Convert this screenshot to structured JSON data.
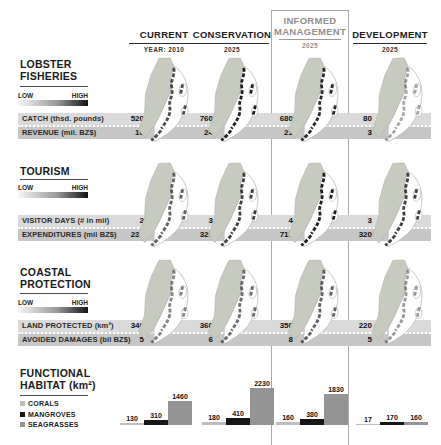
{
  "header": {
    "columns": [
      {
        "label": "CURRENT",
        "sublabel": "YEAR: 2010"
      },
      {
        "label": "CONSERVATION",
        "sublabel": "2025"
      },
      {
        "label": "INFORMED MANAGEMENT",
        "sublabel": "2025"
      },
      {
        "label": "DEVELOPMENT",
        "sublabel": "2025"
      }
    ]
  },
  "scale": {
    "low": "LOW",
    "high": "HIGH"
  },
  "sections": [
    {
      "title_line1": "LOBSTER",
      "title_line2": "FISHERIES",
      "rows": [
        {
          "label": "CATCH (thsd. pounds)",
          "values": [
            "520",
            "760",
            "680",
            "80"
          ]
        },
        {
          "label": "REVENUE (mil. BZ$)",
          "values": [
            "16",
            "24",
            "21",
            "3"
          ]
        }
      ],
      "map_intensity": [
        0.8,
        1,
        0.95,
        0.4
      ]
    },
    {
      "title_line1": "TOURISM",
      "title_line2": "",
      "rows": [
        {
          "label": "VISITOR DAYS (# in mil)",
          "values": [
            "2",
            "3",
            "4",
            "3"
          ]
        },
        {
          "label": "EXPENDITURES (mil BZ$)",
          "values": [
            "230",
            "320",
            "710",
            "320"
          ]
        }
      ],
      "map_intensity": [
        0.7,
        0.85,
        1,
        0.85
      ]
    },
    {
      "title_line1": "COASTAL",
      "title_line2": "PROTECTION",
      "rows": [
        {
          "label": "LAND PROTECTED (km²)",
          "values": [
            "340",
            "360",
            "350",
            "220"
          ]
        },
        {
          "label": "AVOIDED DAMAGES (bil BZ$)",
          "values": [
            "5",
            "6",
            "8",
            "5"
          ]
        }
      ],
      "map_intensity": [
        0.55,
        0.65,
        0.7,
        0.45
      ]
    }
  ],
  "habitat": {
    "title_line1": "FUNCTIONAL",
    "title_line2": "HABITAT (km²)",
    "legend": [
      {
        "label": "CORALS",
        "color": "#bdbdbd"
      },
      {
        "label": "MANGROVES",
        "color": "#161616"
      },
      {
        "label": "SEAGRASSES",
        "color": "#949494"
      }
    ],
    "groups": [
      {
        "column": "CURRENT",
        "values": [
          130,
          310,
          1460
        ]
      },
      {
        "column": "CONSERVATION",
        "values": [
          180,
          410,
          2230
        ]
      },
      {
        "column": "INFORMED MANAGEMENT",
        "values": [
          160,
          380,
          1830
        ]
      },
      {
        "column": "DEVELOPMENT",
        "values": [
          17,
          170,
          160
        ]
      }
    ]
  },
  "colors": {
    "band_light": "#dadada",
    "band_dark": "#c6c6c6",
    "map_land": "#c6cabf",
    "reef_dark": "#1f1f1f",
    "frame": "#ababab",
    "header_muted": "#8f8f8f"
  },
  "chart_data": [
    {
      "type": "table",
      "title": "Ecosystem service outcomes by coastal zoning scenario",
      "columns": [
        "CURRENT (YEAR: 2010)",
        "CONSERVATION (2025)",
        "INFORMED MANAGEMENT (2025)",
        "DEVELOPMENT (2025)"
      ],
      "rows": [
        {
          "section": "LOBSTER FISHERIES",
          "metric": "CATCH (thsd. pounds)",
          "values": [
            520,
            760,
            680,
            80
          ]
        },
        {
          "section": "LOBSTER FISHERIES",
          "metric": "REVENUE (mil. BZ$)",
          "values": [
            16,
            24,
            21,
            3
          ]
        },
        {
          "section": "TOURISM",
          "metric": "VISITOR DAYS (# in mil)",
          "values": [
            2,
            3,
            4,
            3
          ]
        },
        {
          "section": "TOURISM",
          "metric": "EXPENDITURES (mil BZ$)",
          "values": [
            230,
            320,
            710,
            320
          ]
        },
        {
          "section": "COASTAL PROTECTION",
          "metric": "LAND PROTECTED (km²)",
          "values": [
            340,
            360,
            350,
            220
          ]
        },
        {
          "section": "COASTAL PROTECTION",
          "metric": "AVOIDED DAMAGES (bil BZ$)",
          "values": [
            5,
            6,
            8,
            5
          ]
        }
      ],
      "legend_scale": {
        "low": "LOW",
        "high": "HIGH"
      }
    },
    {
      "type": "bar",
      "title": "FUNCTIONAL HABITAT (km²)",
      "categories": [
        "CURRENT",
        "CONSERVATION",
        "INFORMED MANAGEMENT",
        "DEVELOPMENT"
      ],
      "series": [
        {
          "name": "CORALS",
          "values": [
            130,
            180,
            160,
            17
          ]
        },
        {
          "name": "MANGROVES",
          "values": [
            310,
            410,
            380,
            170
          ]
        },
        {
          "name": "SEAGRASSES",
          "values": [
            1460,
            2230,
            1830,
            160
          ]
        }
      ],
      "ylabel": "km²",
      "grid": false,
      "legend_position": "left"
    }
  ]
}
